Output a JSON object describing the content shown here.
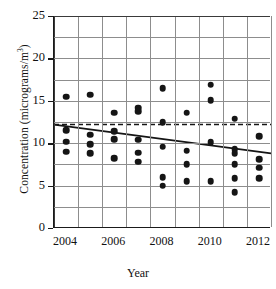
{
  "chart_data": {
    "type": "scatter",
    "title": "",
    "xlabel": "Year",
    "ylabel": "Concentration (micrograms/m",
    "ylabel_exponent": "3",
    "ylabel_tail": ")",
    "xlim": [
      2003.5,
      2012.5
    ],
    "ylim": [
      0,
      25
    ],
    "y_ticks": [
      0,
      5,
      10,
      15,
      20,
      25
    ],
    "y_tick_labels": [
      "0",
      "5",
      "10",
      "15",
      "20",
      "25"
    ],
    "y_gridlines": [
      2.5,
      5,
      7.5,
      10,
      12.5,
      15,
      17.5,
      20,
      22.5,
      25
    ],
    "x_ticks": [
      2004,
      2006,
      2008,
      2010,
      2012
    ],
    "x_tick_labels": [
      "2004",
      "2006",
      "2008",
      "2010",
      "2012"
    ],
    "x_gridlines": [
      2003.5,
      2004.5,
      2005.5,
      2006.5,
      2007.5,
      2008.5,
      2009.5,
      2010.5,
      2011.5,
      2012.5
    ],
    "grid": true,
    "legend": "none",
    "marker_color": "#151515",
    "line_color": "#151515",
    "points": [
      {
        "x": 2004,
        "y": 15.5
      },
      {
        "x": 2004,
        "y": 11.5
      },
      {
        "x": 2004,
        "y": 10.2
      },
      {
        "x": 2004,
        "y": 9.0
      },
      {
        "x": 2005,
        "y": 15.7
      },
      {
        "x": 2005,
        "y": 11.0
      },
      {
        "x": 2005,
        "y": 9.9
      },
      {
        "x": 2005,
        "y": 8.8
      },
      {
        "x": 2006,
        "y": 13.6
      },
      {
        "x": 2006,
        "y": 11.4
      },
      {
        "x": 2006,
        "y": 10.5
      },
      {
        "x": 2006,
        "y": 8.2
      },
      {
        "x": 2007,
        "y": 14.2
      },
      {
        "x": 2007,
        "y": 13.8
      },
      {
        "x": 2007,
        "y": 10.4
      },
      {
        "x": 2007,
        "y": 8.9
      },
      {
        "x": 2007,
        "y": 7.8
      },
      {
        "x": 2008,
        "y": 16.5
      },
      {
        "x": 2008,
        "y": 12.5
      },
      {
        "x": 2008,
        "y": 9.6
      },
      {
        "x": 2008,
        "y": 6.0
      },
      {
        "x": 2008,
        "y": 5.0
      },
      {
        "x": 2009,
        "y": 13.6
      },
      {
        "x": 2009,
        "y": 9.1
      },
      {
        "x": 2009,
        "y": 7.5
      },
      {
        "x": 2009,
        "y": 5.5
      },
      {
        "x": 2010,
        "y": 16.9
      },
      {
        "x": 2010,
        "y": 15.1
      },
      {
        "x": 2010,
        "y": 10.1
      },
      {
        "x": 2010,
        "y": 5.5
      },
      {
        "x": 2011,
        "y": 12.9
      },
      {
        "x": 2011,
        "y": 9.3
      },
      {
        "x": 2011,
        "y": 8.8
      },
      {
        "x": 2011,
        "y": 7.5
      },
      {
        "x": 2011,
        "y": 5.9
      },
      {
        "x": 2011,
        "y": 4.2
      },
      {
        "x": 2012,
        "y": 10.8
      },
      {
        "x": 2012,
        "y": 8.1
      },
      {
        "x": 2012,
        "y": 7.1
      },
      {
        "x": 2012,
        "y": 5.9
      }
    ],
    "reference_line": {
      "style": "dashed",
      "orientation": "horizontal",
      "y": 12.2
    },
    "trend_line": {
      "style": "solid",
      "x_start": 2003.5,
      "y_start": 12.2,
      "x_end": 2012.5,
      "y_end": 8.8
    }
  }
}
